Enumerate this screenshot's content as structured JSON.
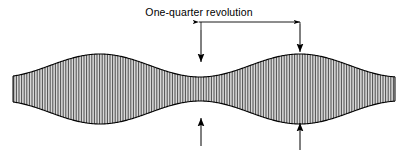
{
  "figure": {
    "title_label": "One-quarter revolution",
    "caption_font_size_px": 10.5,
    "background_color": "#ffffff",
    "stroke_color": "#000000",
    "hatch_color": "#4d4d4d",
    "fill_color": "#d9d9d9",
    "canvas": {
      "width": 407,
      "height": 151
    }
  },
  "annotations": {
    "dimension_arrow": {
      "label": "One-quarter revolution",
      "style": "double-headed-horizontal",
      "x_start": 199,
      "x_end": 300,
      "y": 22
    },
    "leader_lines": [
      {
        "name": "left-leader",
        "x": 201,
        "y_top": 22,
        "y_bottom": 30
      },
      {
        "name": "right-leader",
        "x": 300,
        "y_top": 22,
        "y_bottom": 24
      }
    ],
    "pointer_arrows": [
      {
        "name": "top-waist-arrow",
        "direction": "down",
        "x": 201,
        "y_tail": 30,
        "y_tip": 62
      },
      {
        "name": "top-bulge-arrow",
        "direction": "down",
        "x": 300,
        "y_tail": 24,
        "y_tip": 52
      },
      {
        "name": "bottom-waist-arrow",
        "direction": "up",
        "x": 201,
        "y_tail": 146,
        "y_tip": 118
      },
      {
        "name": "bottom-bulge-arrow",
        "direction": "up",
        "x": 300,
        "y_tail": 150,
        "y_tip": 123
      }
    ]
  },
  "chart_data": {
    "type": "area",
    "title": "One-quarter revolution",
    "xlabel": "",
    "ylabel": "",
    "x_range": [
      13,
      395
    ],
    "y_center": 89,
    "half_width_mean": 23.5,
    "half_width_amplitude": 11.5,
    "wavelength_px": 200,
    "phase_x_waist": 200,
    "waist_positions_x": [
      0,
      200,
      400
    ],
    "bulge_positions_x": [
      100,
      300
    ],
    "waist_half_width": 12,
    "bulge_half_width": 35,
    "hatch_spacing_px": 2.6,
    "hatch_orientation": "vertical",
    "grid": false,
    "legend": "none"
  }
}
